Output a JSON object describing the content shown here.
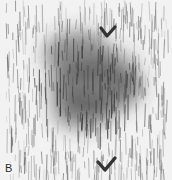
{
  "figure": {
    "panel_label": "B",
    "colors": {
      "background": "#f2f2f2",
      "streak": "#555555",
      "dark_region": "#3a3a3a",
      "arrowhead": "#333333",
      "label": "#2a2a2a"
    },
    "arrowheads": [
      {
        "name": "upper-arrowhead",
        "x": 108,
        "y": 32
      },
      {
        "name": "lower-arrowhead",
        "x": 106,
        "y": 166
      }
    ],
    "dark_region": {
      "cx": 86,
      "cy": 80,
      "rx": 52,
      "ry": 46
    }
  }
}
